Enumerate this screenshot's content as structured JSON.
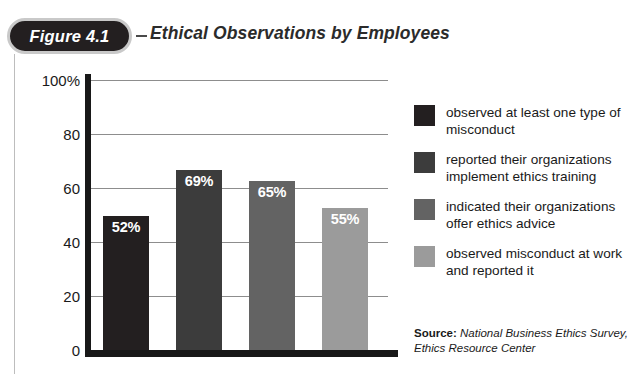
{
  "figure": {
    "pill_label": "Figure 4.1",
    "dash": "–",
    "title": "Ethical Observations by Employees"
  },
  "chart_data": {
    "type": "bar",
    "title": "Ethical Observations by Employees",
    "xlabel": "",
    "ylabel": "",
    "ylim": [
      0,
      100
    ],
    "grid": true,
    "legend_position": "right",
    "categories": [
      "observed at least one type of misconduct",
      "reported their organizations implement ethics training",
      "indicated their organizations offer ethics advice",
      "observed misconduct at work and reported it"
    ],
    "values": [
      52,
      69,
      65,
      55
    ],
    "data_labels": [
      "52%",
      "69%",
      "65%",
      "55%"
    ],
    "colors": [
      "#231f20",
      "#3c3c3c",
      "#636363",
      "#9b9b9b"
    ],
    "yticks": [
      0,
      20,
      40,
      60,
      80,
      100
    ],
    "ytick_labels": [
      "0",
      "20",
      "40",
      "60",
      "80",
      "100%"
    ]
  },
  "legend": {
    "items": [
      {
        "label": "observed at least one type of misconduct",
        "color": "#231f20"
      },
      {
        "label": "reported their organizations implement ethics training",
        "color": "#3c3c3c"
      },
      {
        "label": "indicated their organizations offer ethics advice",
        "color": "#636363"
      },
      {
        "label": "observed misconduct at work and reported it",
        "color": "#9b9b9b"
      }
    ]
  },
  "source": {
    "label": "Source:",
    "text": " National Business Ethics Survey, Ethics Resource Center"
  }
}
